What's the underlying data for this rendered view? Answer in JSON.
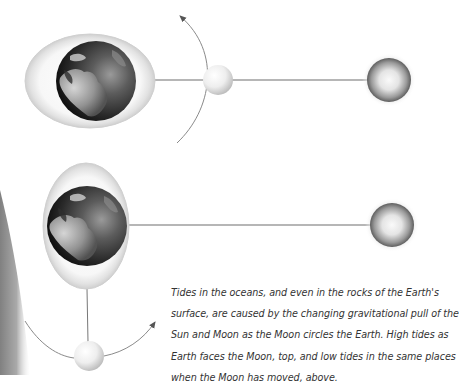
{
  "figure": {
    "caption_lines": [
      "Tides in the oceans, and even in the rocks of the Earth's",
      "surface, are caused by the changing gravitational pull of the",
      "Sun and Moon as the Moon circles the Earth. High tides as",
      "Earth faces the Moon, top, and low tides in the same places",
      "when the Moon has moved, above."
    ],
    "panels": [
      {
        "name": "high-tide",
        "earth": {
          "cx": 96,
          "cy": 81,
          "r": 40
        },
        "tidal_bulge": {
          "cx": 90,
          "cy": 81,
          "rx": 65,
          "ry": 47,
          "orientation": "horizontal"
        },
        "moon": {
          "cx": 218,
          "cy": 80,
          "r": 15
        },
        "sun": {
          "cx": 389,
          "cy": 80,
          "r": 22
        },
        "orbit_arrow": "counterclockwise-up"
      },
      {
        "name": "low-tide",
        "earth": {
          "cx": 87,
          "cy": 226,
          "r": 40
        },
        "tidal_bulge": {
          "cx": 86,
          "cy": 226,
          "rx": 43,
          "ry": 63,
          "orientation": "vertical"
        },
        "moon": {
          "cx": 89,
          "cy": 356,
          "r": 15
        },
        "sun": {
          "cx": 392,
          "cy": 225,
          "r": 22
        },
        "orbit_arrow": "counterclockwise-right"
      }
    ],
    "colors": {
      "line": "#6e6e6e",
      "arc": "#8a8a8a",
      "ocean_dark": "#1c1c1c",
      "text": "#333333"
    }
  }
}
